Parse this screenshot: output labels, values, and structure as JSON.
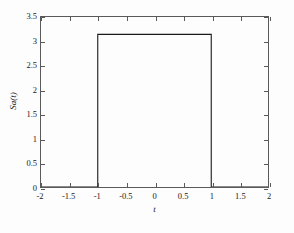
{
  "figure": {
    "background_color": "#fdfdfd",
    "axis_color": "#5a5a5a",
    "line_color": "#1a1a1a"
  },
  "chart_data": {
    "type": "line",
    "title": "",
    "xlabel": "t",
    "ylabel": "Sa(t)",
    "xlim": [
      -2,
      2
    ],
    "ylim": [
      0,
      3.5
    ],
    "grid": false,
    "legend": null,
    "xticks": [
      -2,
      -1.5,
      -1,
      -0.5,
      0,
      0.5,
      1,
      1.5,
      2
    ],
    "xtick_labels": [
      "-2",
      "-1.5",
      "-1",
      "-0.5",
      "0",
      "0.5",
      "1",
      "1.5",
      "2"
    ],
    "yticks": [
      0,
      0.5,
      1,
      1.5,
      2,
      2.5,
      3,
      3.5
    ],
    "ytick_labels": [
      "0",
      "0.5",
      "1",
      "1.5",
      "2",
      "2.5",
      "3",
      "3.5"
    ],
    "series": [
      {
        "name": "Sa(t)",
        "description": "rectangular pulse of amplitude pi on the interval -1 to 1",
        "amplitude": 3.1416,
        "pulse_start": -1,
        "pulse_end": 1,
        "x": [
          -2,
          -1,
          -1,
          1,
          1,
          2
        ],
        "y": [
          0,
          0,
          3.1416,
          3.1416,
          0,
          0
        ]
      }
    ]
  }
}
